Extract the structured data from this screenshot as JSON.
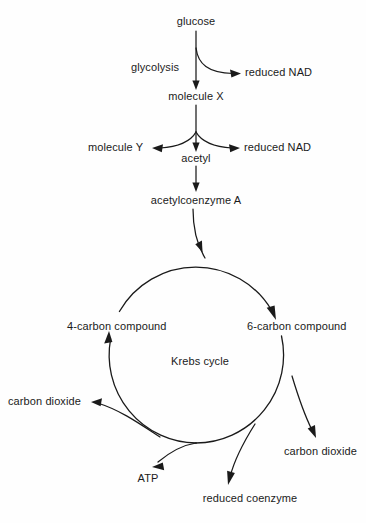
{
  "diagram": {
    "background_color": "#fefefe",
    "line_color": "#1a1a1a",
    "text_color": "#1b1b1b",
    "nodes": {
      "glucose": "glucose",
      "glycolysis": "glycolysis",
      "reduced_nad_1": "reduced NAD",
      "molecule_x": "molecule X",
      "molecule_y": "molecule Y",
      "reduced_nad_2": "reduced NAD",
      "acetyl": "acetyl",
      "acetyl_coenzyme_a": "acetylcoenzyme A",
      "four_carbon_compound": "4-carbon compound",
      "six_carbon_compound": "6-carbon compound",
      "krebs_cycle": "Krebs cycle",
      "carbon_dioxide_left": "carbon dioxide",
      "carbon_dioxide_right": "carbon dioxide",
      "atp": "ATP",
      "reduced_coenzyme": "reduced coenzyme"
    },
    "cycle": {
      "center_x": 196,
      "center_y": 355,
      "radius": 88,
      "direction": "clockwise"
    }
  }
}
